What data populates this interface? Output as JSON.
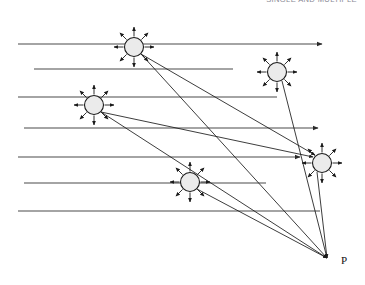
{
  "figure": {
    "caption_partial": "SINGLE AND MULTIPLE",
    "background_color": "#ffffff",
    "line_color": "#3a3a3a",
    "ray_color": "#1a1a1a",
    "scatterer_fill": "#ebebeb",
    "scatterer_stroke": "#1a1a1a"
  },
  "labels": {
    "observation_point": "P"
  },
  "chart_data": {
    "type": "diagram",
    "xlabel": "",
    "ylabel": "",
    "width": 365,
    "height": 285,
    "observation_point": {
      "name": "P",
      "x": 327,
      "y": 258,
      "label": "P"
    },
    "incident_rays": [
      {
        "id": "ray-1",
        "y": 44,
        "x_start": 18,
        "x_end": 322,
        "arrow_end": true,
        "hits": []
      },
      {
        "id": "ray-2",
        "y": 69,
        "x_start": 34,
        "x_end": 233,
        "arrow_end": false,
        "hits": []
      },
      {
        "id": "ray-3",
        "y": 97,
        "x_start": 18,
        "x_end": 277,
        "arrow_end": false,
        "hits": [
          "s3"
        ]
      },
      {
        "id": "ray-4",
        "y": 128,
        "x_start": 24,
        "x_end": 318,
        "arrow_end": true,
        "hits": []
      },
      {
        "id": "ray-5",
        "y": 157,
        "x_start": 18,
        "x_end": 300,
        "arrow_end": true,
        "hits": [
          "s5"
        ]
      },
      {
        "id": "ray-6",
        "y": 183,
        "x_start": 24,
        "x_end": 266,
        "arrow_end": false,
        "hits": [
          "s4"
        ]
      },
      {
        "id": "ray-7",
        "y": 211,
        "x_start": 18,
        "x_end": 320,
        "arrow_end": false,
        "hits": []
      }
    ],
    "scatterers": [
      {
        "id": "s1",
        "x": 134,
        "y": 47,
        "radius": 9.5,
        "spoke_count": 8,
        "spoke_length": 20
      },
      {
        "id": "s2",
        "x": 277,
        "y": 72,
        "radius": 9.5,
        "spoke_count": 8,
        "spoke_length": 20
      },
      {
        "id": "s3",
        "x": 94,
        "y": 105,
        "radius": 9.5,
        "spoke_count": 8,
        "spoke_length": 20
      },
      {
        "id": "s4",
        "x": 190,
        "y": 182,
        "radius": 9.5,
        "spoke_count": 8,
        "spoke_length": 20
      },
      {
        "id": "s5",
        "x": 322,
        "y": 163,
        "radius": 9.5,
        "spoke_count": 8,
        "spoke_length": 20
      }
    ],
    "scattered_rays_to_P": [
      {
        "from": "s1",
        "x1": 141,
        "y1": 54,
        "x2": 327,
        "y2": 258,
        "arrow_end": true
      },
      {
        "from": "s2",
        "x1": 282,
        "y1": 81,
        "x2": 327,
        "y2": 258,
        "arrow_end": true
      },
      {
        "from": "s3",
        "x1": 101,
        "y1": 112,
        "x2": 327,
        "y2": 258,
        "arrow_end": true
      },
      {
        "from": "s4",
        "x1": 197,
        "y1": 189,
        "x2": 327,
        "y2": 258,
        "arrow_end": true
      },
      {
        "from": "s5",
        "x1": 317,
        "y1": 172,
        "x2": 327,
        "y2": 258,
        "arrow_end": true
      },
      {
        "from": "s1-secondary",
        "x1": 141,
        "y1": 54,
        "x2": 315,
        "y2": 155,
        "arrow_end": true
      },
      {
        "from": "s3-secondary",
        "x1": 101,
        "y1": 112,
        "x2": 313,
        "y2": 157,
        "arrow_end": true
      }
    ]
  }
}
